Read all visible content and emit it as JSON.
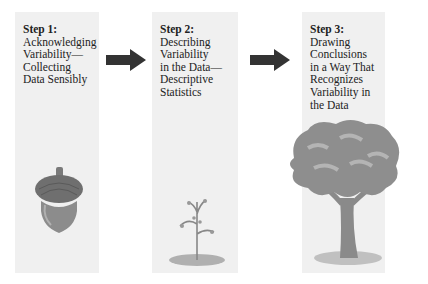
{
  "steps": [
    {
      "title": "Step 1:",
      "lines": [
        "Acknowledging",
        "Variability—",
        "Collecting",
        "Data Sensibly"
      ],
      "illustration": "acorn-icon"
    },
    {
      "title": "Step 2:",
      "lines": [
        "Describing",
        "Variability",
        "in the Data—",
        "Descriptive",
        "Statistics"
      ],
      "illustration": "sapling-icon"
    },
    {
      "title": "Step 3:",
      "lines": [
        "Drawing",
        "Conclusions",
        "in a Way That",
        "Recognizes",
        "Variability in",
        "the Data"
      ],
      "illustration": "tree-icon"
    }
  ],
  "arrows": [
    "right-arrow-icon",
    "right-arrow-icon"
  ],
  "colors": {
    "panel": "#f0f0f0",
    "arrow": "#333333",
    "illustration": "#8a8a8a"
  }
}
